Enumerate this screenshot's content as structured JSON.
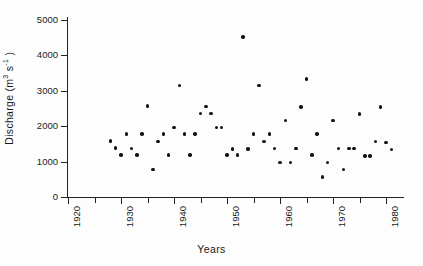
{
  "chart_data": {
    "type": "scatter",
    "title": "",
    "xlabel": "Years",
    "ylabel": "Discharge  (m3 s-1)",
    "ylabel_plain": "Discharge (m3 s-1)",
    "ylabel_parts": {
      "name": "Discharge",
      "open": " (m",
      "exp1": "3",
      "mid": " s",
      "exp2": "-1",
      "close": " )"
    },
    "xlim": [
      1920,
      1984
    ],
    "ylim": [
      0,
      5200
    ],
    "xticks": [
      1920,
      1925,
      1930,
      1935,
      1940,
      1945,
      1950,
      1955,
      1960,
      1965,
      1970,
      1975,
      1980
    ],
    "xtick_labels": [
      "1920",
      "",
      "1930",
      "",
      "1940",
      "",
      "1950",
      "",
      "1960",
      "",
      "1970",
      "",
      "1980"
    ],
    "yticks": [
      0,
      1000,
      2000,
      3000,
      4000,
      5000
    ],
    "ytick_labels": [
      "0",
      "1000",
      "2000",
      "3000",
      "4000",
      "5000"
    ],
    "grid": false,
    "legend": false,
    "marker_color": "#111111",
    "axis_color": "#232323",
    "background_color": "#fdfdfd",
    "x": [
      1928,
      1929,
      1930,
      1931,
      1932,
      1933,
      1934,
      1935,
      1936,
      1937,
      1938,
      1939,
      1940,
      1941,
      1942,
      1943,
      1944,
      1945,
      1946,
      1947,
      1948,
      1949,
      1950,
      1951,
      1952,
      1953,
      1954,
      1955,
      1956,
      1957,
      1958,
      1959,
      1960,
      1961,
      1962,
      1963,
      1964,
      1965,
      1966,
      1967,
      1968,
      1969,
      1970,
      1971,
      1972,
      1973,
      1974,
      1975,
      1976,
      1977,
      1978,
      1979,
      1980,
      1981,
      1982
    ],
    "y": [
      1580,
      1380,
      1180,
      1780,
      1370,
      1180,
      1780,
      2560,
      780,
      1560,
      1780,
      1180,
      1960,
      3140,
      1780,
      1180,
      1780,
      2350,
      2550,
      2350,
      1960,
      1960,
      1180,
      1350,
      1180,
      4500,
      1350,
      1780,
      3140,
      1560,
      1780,
      1370,
      970,
      2150,
      970,
      1370,
      2540,
      3320,
      1180,
      1780,
      560,
      970,
      2150,
      1370,
      780,
      1370,
      1370,
      2340,
      1160,
      1160,
      1560,
      2540,
      1540,
      1340
    ],
    "points": [
      {
        "year": 1928,
        "discharge": 1580
      },
      {
        "year": 1929,
        "discharge": 1380
      },
      {
        "year": 1930,
        "discharge": 1180
      },
      {
        "year": 1931,
        "discharge": 1780
      },
      {
        "year": 1932,
        "discharge": 1370
      },
      {
        "year": 1933,
        "discharge": 1180
      },
      {
        "year": 1934,
        "discharge": 1780
      },
      {
        "year": 1935,
        "discharge": 2560
      },
      {
        "year": 1936,
        "discharge": 780
      },
      {
        "year": 1937,
        "discharge": 1560
      },
      {
        "year": 1938,
        "discharge": 1780
      },
      {
        "year": 1939,
        "discharge": 1180
      },
      {
        "year": 1940,
        "discharge": 1960
      },
      {
        "year": 1941,
        "discharge": 3140
      },
      {
        "year": 1942,
        "discharge": 1780
      },
      {
        "year": 1943,
        "discharge": 1180
      },
      {
        "year": 1944,
        "discharge": 1780
      },
      {
        "year": 1945,
        "discharge": 2350
      },
      {
        "year": 1946,
        "discharge": 2550
      },
      {
        "year": 1947,
        "discharge": 2350
      },
      {
        "year": 1948,
        "discharge": 1960
      },
      {
        "year": 1949,
        "discharge": 1960
      },
      {
        "year": 1950,
        "discharge": 1180
      },
      {
        "year": 1951,
        "discharge": 1350
      },
      {
        "year": 1952,
        "discharge": 1180
      },
      {
        "year": 1953,
        "discharge": 4500
      },
      {
        "year": 1954,
        "discharge": 1350
      },
      {
        "year": 1955,
        "discharge": 1780
      },
      {
        "year": 1956,
        "discharge": 3140
      },
      {
        "year": 1957,
        "discharge": 1560
      },
      {
        "year": 1958,
        "discharge": 1780
      },
      {
        "year": 1959,
        "discharge": 1370
      },
      {
        "year": 1960,
        "discharge": 970
      },
      {
        "year": 1961,
        "discharge": 2150
      },
      {
        "year": 1962,
        "discharge": 970
      },
      {
        "year": 1963,
        "discharge": 1370
      },
      {
        "year": 1964,
        "discharge": 2540
      },
      {
        "year": 1965,
        "discharge": 3320
      },
      {
        "year": 1966,
        "discharge": 1180
      },
      {
        "year": 1967,
        "discharge": 1780
      },
      {
        "year": 1968,
        "discharge": 560
      },
      {
        "year": 1969,
        "discharge": 970
      },
      {
        "year": 1970,
        "discharge": 2150
      },
      {
        "year": 1971,
        "discharge": 1370
      },
      {
        "year": 1972,
        "discharge": 780
      },
      {
        "year": 1973,
        "discharge": 1370
      },
      {
        "year": 1974,
        "discharge": 1370
      },
      {
        "year": 1975,
        "discharge": 2340
      },
      {
        "year": 1976,
        "discharge": 1160
      },
      {
        "year": 1977,
        "discharge": 1160
      },
      {
        "year": 1978,
        "discharge": 1560
      },
      {
        "year": 1979,
        "discharge": 2540
      },
      {
        "year": 1980,
        "discharge": 1540
      },
      {
        "year": 1981,
        "discharge": 1340
      }
    ]
  }
}
